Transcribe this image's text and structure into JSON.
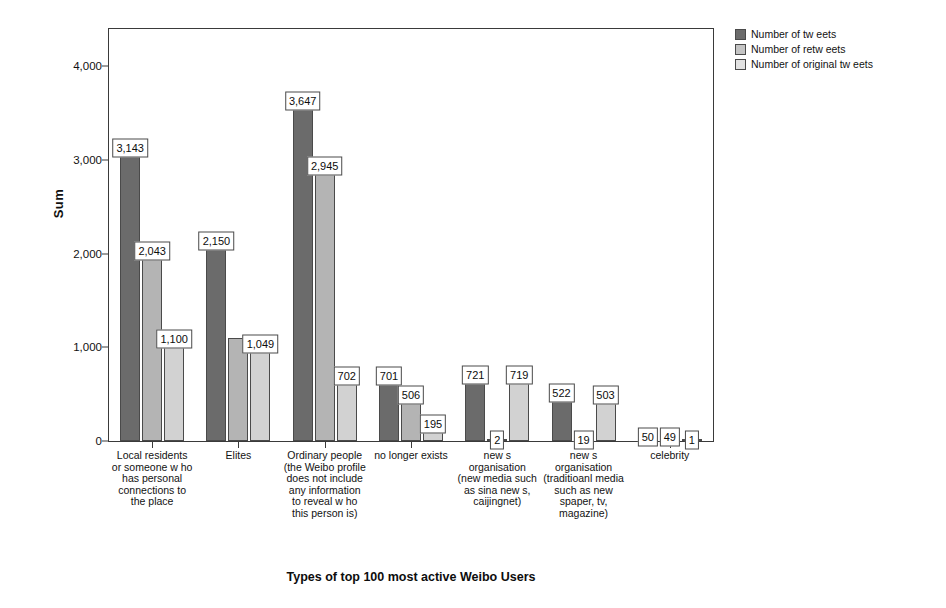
{
  "chart_data": {
    "type": "bar",
    "title": "",
    "xlabel": "Types of top 100 most active Weibo Users",
    "ylabel": "Sum",
    "ylim": [
      0,
      4400
    ],
    "yticks": [
      0,
      1000,
      2000,
      3000,
      4000
    ],
    "ytick_labels": [
      "0",
      "1,000",
      "2,000",
      "3,000",
      "4,000"
    ],
    "grid": false,
    "legend_position": "top-right",
    "categories": [
      "Local residents or someone w ho has personal connections to the place",
      "Elites",
      "Ordinary people (the Weibo profile does not include any information to reveal w ho this person is)",
      "no longer exists",
      "new s organisation (new media such as sina new s, caijingnet)",
      "new s organisation (traditioanl media such as new spaper, tv, magazine)",
      "celebrity"
    ],
    "series": [
      {
        "name": "Number of tw eets",
        "color": "#6b6b6b",
        "values": [
          3143,
          2150,
          3647,
          701,
          721,
          522,
          50
        ],
        "labels": [
          "3,143",
          "2,150",
          "3,647",
          "701",
          "721",
          "522",
          "50"
        ]
      },
      {
        "name": "Number of retw eets",
        "color": "#b4b4b4",
        "values": [
          2043,
          1101,
          2945,
          506,
          2,
          19,
          49
        ],
        "labels": [
          "2,043",
          "",
          "2,945",
          "506",
          "2",
          "19",
          "49"
        ]
      },
      {
        "name": "Number of original tw eets",
        "color": "#d2d2d2",
        "values": [
          1100,
          1049,
          702,
          195,
          719,
          503,
          1
        ],
        "labels": [
          "1,100",
          "1,049",
          "702",
          "195",
          "719",
          "503",
          "1"
        ]
      }
    ]
  },
  "axes": {
    "y_title": "Sum",
    "x_title": "Types of top 100 most active Weibo Users"
  }
}
